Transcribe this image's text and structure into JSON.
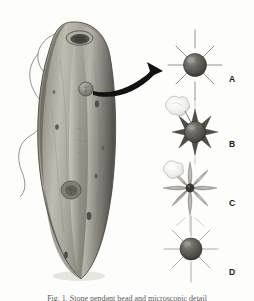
{
  "figure": {
    "background_color": "#fdfdfc",
    "caption": "Fig. 1. Stone pendant bead and microscopic detail",
    "artifact": {
      "name": "perforated-stone-pendant",
      "description": "Elongated teardrop ground-stone pendant with suspension hole at top, a raised circular boss near the upper centre, a second eroded circular depression mid-body, several small pits, and a thin cord threaded through the hole looping to the left.",
      "body_color_light": "#c8c6bd",
      "body_color_mid": "#9b988d",
      "body_color_dark": "#5d5a52",
      "outline_color": "#4a4842",
      "cord_color": "#5a5750"
    },
    "arrow": {
      "name": "callout-arrow",
      "color": "#131313",
      "description": "Curved solid black arrow from the boss on the artifact to panel A"
    },
    "panels": [
      {
        "id": "A",
        "label": "A",
        "type": "sphere-with-thin-rays",
        "ray_count": 8,
        "ray_style": "thin straight gray lines",
        "body": "dark gray glossy sphere",
        "blob": false,
        "body_color": "#56544f",
        "ray_color": "#908d86"
      },
      {
        "id": "B",
        "label": "B",
        "type": "sphere-with-thick-spikes",
        "ray_count": 8,
        "ray_style": "thick tapered dark spikes",
        "body": "dark gray sphere",
        "blob": true,
        "blob_position": "upper-left",
        "body_color": "#56544f",
        "ray_color": "#4f4d47"
      },
      {
        "id": "C",
        "label": "C",
        "type": "small-core-with-long-spikes",
        "ray_count": 9,
        "ray_style": "long slender leaf-shaped pale spikes",
        "body": "small dark core",
        "blob": true,
        "blob_position": "upper-left",
        "body_color": "#3c3a36",
        "ray_color": "#b6b3ab"
      },
      {
        "id": "D",
        "label": "D",
        "type": "sphere-with-thin-rays",
        "ray_count": 8,
        "ray_style": "thin straight gray lines",
        "body": "dark gray glossy sphere",
        "blob": false,
        "body_color": "#56544f",
        "ray_color": "#a6a39b"
      }
    ]
  }
}
